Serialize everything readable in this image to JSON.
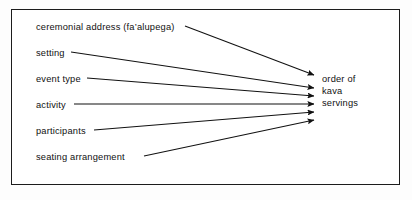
{
  "figure": {
    "kind": "convergent-factor-diagram",
    "frame_border_color": "#1c1c1c",
    "background_color": "#ffffff",
    "text_color": "#111111",
    "arrow_color": "#111111"
  },
  "sources": [
    {
      "id": "ceremonial-address",
      "label": "ceremonial address (fa’alupega)",
      "x": 36,
      "y": 22,
      "line_start_x": 185,
      "line_start_y": 26,
      "tip_y": 75
    },
    {
      "id": "setting",
      "label": "setting",
      "x": 36,
      "y": 48,
      "line_start_x": 71,
      "line_start_y": 52,
      "tip_y": 88
    },
    {
      "id": "event-type",
      "label": "event type",
      "x": 36,
      "y": 74,
      "line_start_x": 87,
      "line_start_y": 78,
      "tip_y": 96
    },
    {
      "id": "activity",
      "label": "activity",
      "x": 36,
      "y": 100,
      "line_start_x": 74,
      "line_start_y": 104,
      "tip_y": 104
    },
    {
      "id": "participants",
      "label": "participants",
      "x": 36,
      "y": 126,
      "line_start_x": 94,
      "line_start_y": 130,
      "tip_y": 112
    },
    {
      "id": "seating-arrangement",
      "label": "seating arrangement",
      "x": 36,
      "y": 152,
      "line_start_x": 144,
      "line_start_y": 156,
      "tip_y": 120
    }
  ],
  "target": {
    "id": "order-of-kava-servings",
    "lines": [
      "order of",
      "kava",
      "servings"
    ],
    "full_text": "order of kava servings",
    "tip_x": 314
  },
  "chart_data": {
    "type": "diagram",
    "title": "",
    "relationship": "many-to-one influence",
    "arrow_count": 6,
    "nodes_from": [
      "ceremonial address (fa’alupega)",
      "setting",
      "event type",
      "activity",
      "participants",
      "seating arrangement"
    ],
    "node_to": "order of kava servings"
  }
}
